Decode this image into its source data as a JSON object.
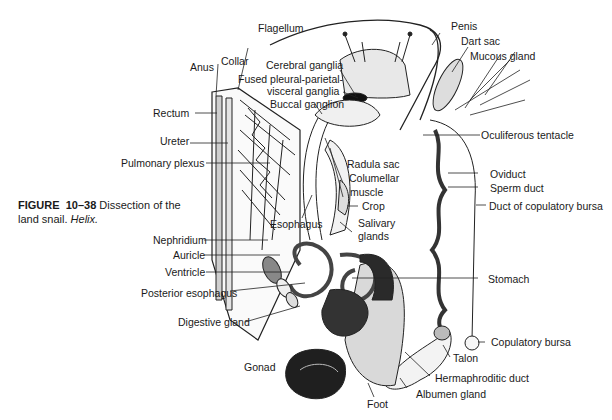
{
  "caption": {
    "figure_label": "FIGURE",
    "figure_number": "10–38",
    "text": "Dissection of the land snail.",
    "genus": "Helix."
  },
  "labels": {
    "flagellum": "Flagellum",
    "penis": "Penis",
    "dart_sac": "Dart sac",
    "mucous_gland": "Mucous gland",
    "anus": "Anus",
    "collar": "Collar",
    "cerebral_ganglia": "Cerebral ganglia",
    "fused_ganglia_1": "Fused pleural-parietal-",
    "fused_ganglia_2": "visceral ganglia",
    "buccal_ganglion": "Buccal ganglion",
    "rectum": "Rectum",
    "ureter": "Ureter",
    "pulmonary_plexus": "Pulmonary plexus",
    "oculiferous_tentacle": "Oculiferous tentacle",
    "radula_sac": "Radula sac",
    "columellar_muscle_1": "Columellar",
    "columellar_muscle_2": "muscle",
    "oviduct": "Oviduct",
    "sperm_duct": "Sperm duct",
    "duct_copulatory_bursa": "Duct of copulatory bursa",
    "esophagus": "Esophagus",
    "crop": "Crop",
    "salivary_glands_1": "Salivary",
    "salivary_glands_2": "glands",
    "nephridium": "Nephridium",
    "auricle": "Auricle",
    "ventricle": "Ventricle",
    "posterior_esophagus": "Posterior esophagus",
    "stomach": "Stomach",
    "digestive_gland": "Digestive gland",
    "copulatory_bursa": "Copulatory bursa",
    "talon": "Talon",
    "gonad": "Gonad",
    "hermaphroditic_duct": "Hermaphroditic duct",
    "albumen_gland": "Albumen gland",
    "foot": "Foot"
  }
}
